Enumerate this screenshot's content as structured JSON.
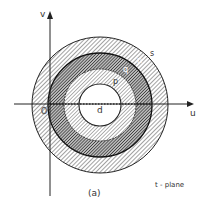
{
  "figure": {
    "caption": "(a)",
    "plane_label": "t - plane",
    "axes": {
      "x_label": "u",
      "y_label": "v",
      "origin_label": "O"
    },
    "center_label": "d",
    "regions": [
      {
        "label": "s",
        "description": "outer ring, light hatching"
      },
      {
        "label": "n",
        "description": "boundary between s and q"
      },
      {
        "label": "q",
        "description": "middle ring, dense/dark hatching"
      },
      {
        "label": "p",
        "description": "inner ring, light hatching"
      }
    ],
    "colors": {
      "ink": "#222222",
      "background": "#ffffff"
    }
  }
}
